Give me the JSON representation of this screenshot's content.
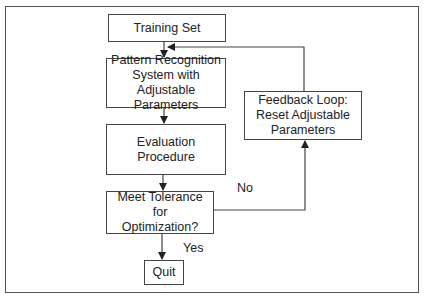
{
  "diagram": {
    "type": "flowchart",
    "nodes": {
      "training_set": "Training Set",
      "pattern_recognition": "Pattern Recognition System with Adjustable Parameters",
      "evaluation": "Evaluation Procedure",
      "decision": "Meet Tolerance for Optimization?",
      "quit": "Quit",
      "feedback": "Feedback Loop: Reset Adjustable Parameters"
    },
    "edge_labels": {
      "no": "No",
      "yes": "Yes"
    },
    "edges": [
      {
        "from": "training_set",
        "to": "pattern_recognition"
      },
      {
        "from": "pattern_recognition",
        "to": "evaluation"
      },
      {
        "from": "evaluation",
        "to": "decision"
      },
      {
        "from": "decision",
        "to": "quit",
        "label": "Yes"
      },
      {
        "from": "decision",
        "to": "feedback",
        "label": "No"
      },
      {
        "from": "feedback",
        "to": "pattern_recognition"
      }
    ],
    "colors": {
      "line": "#444444",
      "frame": "#555555",
      "background": "#ffffff"
    }
  }
}
